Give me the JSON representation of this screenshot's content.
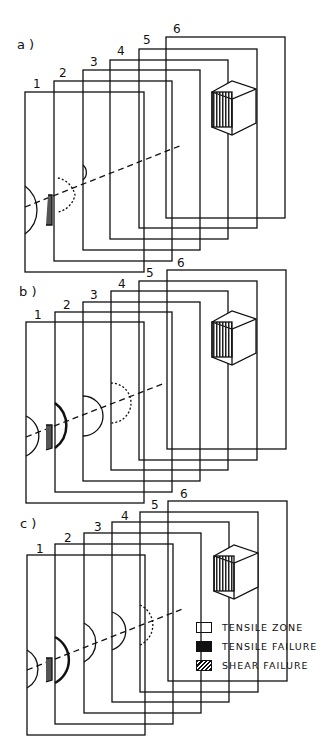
{
  "panels": [
    {
      "label": "a )",
      "frame_numbers": [
        "1",
        "2",
        "3",
        "4",
        "5",
        "6"
      ],
      "top": 37
    },
    {
      "label": "b )",
      "frame_numbers": [
        "1",
        "2",
        "3",
        "4",
        "5",
        "6"
      ],
      "top": 270
    },
    {
      "label": "c )",
      "frame_numbers": [
        "1",
        "2",
        "3",
        "4",
        "5",
        "6"
      ],
      "top": 501
    }
  ],
  "specimen_labels": {
    "top_left": "1",
    "top_right": "6",
    "bottom_left": "1",
    "bottom_right": "6"
  },
  "legend": [
    {
      "label": "TENSILE ZONE",
      "swatch": "white"
    },
    {
      "label": "TENSILE FAILURE",
      "swatch": "black"
    },
    {
      "label": "SHEAR FAILURE",
      "swatch": "hatched"
    }
  ]
}
